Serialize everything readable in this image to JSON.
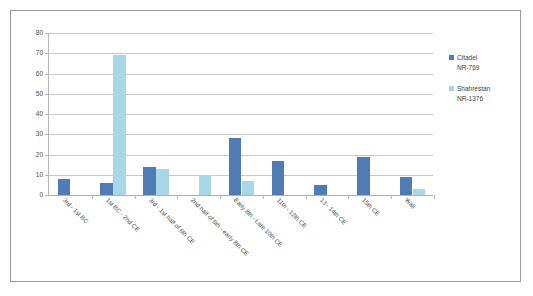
{
  "chart_data": {
    "type": "bar",
    "title": "",
    "xlabel": "",
    "ylabel": "",
    "ylim": [
      0,
      80
    ],
    "ytick_step": 10,
    "yticks": [
      0,
      10,
      20,
      30,
      40,
      50,
      60,
      70,
      80
    ],
    "grid": true,
    "legend_position": "right",
    "categories": [
      "3rd - 1st BC",
      "1st BC - 2nd CE",
      "3rd - 1st half of 6th CE",
      "2nd half of 6th - early 8th CE",
      "Early 8th - Late 10th CE",
      "11th - 12th CE",
      "13 - 14th CE",
      "15th CE",
      "Wall"
    ],
    "series": [
      {
        "name": "Citadel NR-769",
        "legend_line1": "Citadel",
        "legend_line2": "NR-769",
        "color": "#4f7cb5",
        "values": [
          8,
          6,
          14,
          0,
          28,
          17,
          5,
          19,
          9
        ]
      },
      {
        "name": "Shahrestan NR-1376",
        "legend_line1": "Shahrestan",
        "legend_line2": "NR-1376",
        "color": "#a8d8e8",
        "values": [
          0,
          69,
          13,
          10,
          7,
          0,
          0,
          0,
          3
        ]
      }
    ]
  },
  "colors": {
    "series_0": "#4f7cb5",
    "series_1": "#a8d8e8",
    "gridline": "#c8c8c8",
    "axis": "#b7b7b7",
    "frame_border": "#9a9a9a",
    "text": "#4b4b4b",
    "background": "#ffffff"
  }
}
